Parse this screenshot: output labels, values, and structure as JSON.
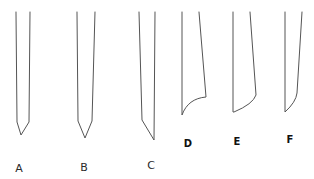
{
  "diagram": {
    "stroke_color": "#555555",
    "shapes": [
      {
        "id": "A",
        "label": "A",
        "tip_type": "symmetric-point",
        "points": [
          [
            16,
            12
          ],
          [
            17,
            122
          ],
          [
            21,
            135
          ],
          [
            29,
            122
          ],
          [
            30,
            12
          ]
        ],
        "label_pos": [
          19,
          168
        ],
        "bold": false
      },
      {
        "id": "B",
        "label": "B",
        "tip_type": "symmetric-point",
        "points": [
          [
            77,
            12
          ],
          [
            78,
            121
          ],
          [
            85,
            138
          ],
          [
            92,
            121
          ],
          [
            95,
            12
          ]
        ],
        "label_pos": [
          84,
          167
        ],
        "bold": false
      },
      {
        "id": "C",
        "label": "C",
        "tip_type": "single-bevel-point",
        "points": [
          [
            139,
            12
          ],
          [
            142,
            120
          ],
          [
            154,
            140
          ],
          [
            155,
            12
          ]
        ],
        "label_pos": [
          151,
          165
        ],
        "bold": false
      },
      {
        "id": "D",
        "label": "D",
        "tip_type": "curved-bevel",
        "points": [
          [
            182,
            12
          ],
          [
            182,
            115
          ],
          "C 186 104 194 98 206 97",
          [
            206,
            97
          ],
          [
            199,
            12
          ]
        ],
        "label_pos": [
          188,
          144
        ],
        "bold": true
      },
      {
        "id": "E",
        "label": "E",
        "tip_type": "curved-bevel",
        "points": [
          [
            233,
            12
          ],
          [
            244,
            112
          ],
          "Q 255 104 256 95",
          [
            256,
            95
          ],
          [
            250,
            12
          ]
        ],
        "label_pos": [
          237,
          142
        ],
        "bold": true
      },
      {
        "id": "F",
        "label": "F",
        "tip_type": "curved-bevel",
        "points": [
          [
            285,
            12
          ],
          [
            285,
            112
          ],
          "Q 296 102 297 93",
          [
            297,
            93
          ],
          [
            302,
            12
          ]
        ],
        "label_pos": [
          290,
          140
        ],
        "bold": true
      }
    ]
  }
}
